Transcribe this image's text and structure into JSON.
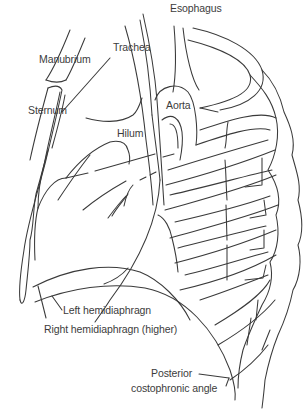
{
  "figure": {
    "line_color": "#3a3a3a",
    "text_color": "#3c3c3c",
    "background": "#ffffff"
  },
  "labels": {
    "esophagus": "Esophagus",
    "trachea": "Trachea",
    "manubrium": "Manubrium",
    "aorta": "Aorta",
    "sternum": "Sternum",
    "hilum": "Hilum",
    "left_hemidiaphragm": "Left hemidiaphragn",
    "right_hemidiaphragm": "Right hemidiaphragn (higher)",
    "posterior_line1": "Posterior",
    "posterior_line2": "costophronic angle"
  }
}
